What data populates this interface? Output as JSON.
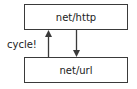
{
  "diagram": {
    "nodes": [
      {
        "id": "top",
        "label": "net/http"
      },
      {
        "id": "bottom",
        "label": "net/url"
      }
    ],
    "edges": [
      {
        "from": "bottom",
        "to": "top",
        "direction": "up"
      },
      {
        "from": "top",
        "to": "bottom",
        "direction": "down"
      }
    ],
    "annotation": "cycle!",
    "colors": {
      "stroke": "#3a3a3a",
      "background": "#ffffff",
      "text": "#222222"
    }
  }
}
